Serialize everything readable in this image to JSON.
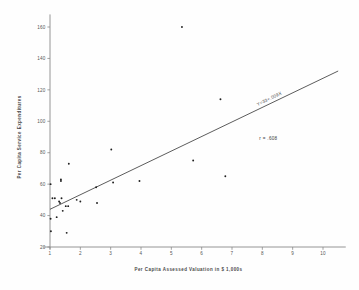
{
  "chart_data": {
    "type": "scatter",
    "title": "",
    "xlabel": "Per Capita  Assessed Valuation in $ 1,000s",
    "ylabel": "Per Capita Service Expenditures",
    "xlim": [
      0.6,
      10.8
    ],
    "ylim": [
      18,
      168
    ],
    "xticks": [
      "1",
      "2",
      "3",
      "4",
      "5",
      "6",
      "7",
      "8",
      "9",
      "10"
    ],
    "xtick_values": [
      1,
      2,
      3,
      4,
      5,
      6,
      7,
      8,
      9,
      10
    ],
    "yticks": [
      "20",
      "40",
      "60",
      "80",
      "100",
      "120",
      "140",
      "160"
    ],
    "ytick_values": [
      20,
      40,
      60,
      80,
      100,
      120,
      140,
      160
    ],
    "grid": false,
    "legend": "none",
    "points": [
      {
        "x": 1.02,
        "y": 60
      },
      {
        "x": 1.02,
        "y": 38
      },
      {
        "x": 1.03,
        "y": 30
      },
      {
        "x": 1.08,
        "y": 51
      },
      {
        "x": 1.16,
        "y": 51
      },
      {
        "x": 1.22,
        "y": 39
      },
      {
        "x": 1.3,
        "y": 49
      },
      {
        "x": 1.33,
        "y": 48
      },
      {
        "x": 1.36,
        "y": 62
      },
      {
        "x": 1.36,
        "y": 63
      },
      {
        "x": 1.38,
        "y": 51
      },
      {
        "x": 1.42,
        "y": 43
      },
      {
        "x": 1.52,
        "y": 46
      },
      {
        "x": 1.55,
        "y": 29
      },
      {
        "x": 1.6,
        "y": 46
      },
      {
        "x": 1.62,
        "y": 73
      },
      {
        "x": 1.88,
        "y": 50
      },
      {
        "x": 2.0,
        "y": 49
      },
      {
        "x": 2.52,
        "y": 58
      },
      {
        "x": 2.55,
        "y": 48
      },
      {
        "x": 3.02,
        "y": 82
      },
      {
        "x": 3.08,
        "y": 61
      },
      {
        "x": 3.95,
        "y": 62
      },
      {
        "x": 5.35,
        "y": 160
      },
      {
        "x": 5.72,
        "y": 75
      },
      {
        "x": 6.62,
        "y": 114
      },
      {
        "x": 6.78,
        "y": 65
      }
    ],
    "fit_line": {
      "label": "Y=33+.009X",
      "x_start": 1.0,
      "y_start": 44,
      "x_end": 10.5,
      "y_end": 132
    },
    "annotations": [
      {
        "name": "correlation",
        "text": "r = .608",
        "x": 8.2,
        "y": 88
      }
    ]
  }
}
